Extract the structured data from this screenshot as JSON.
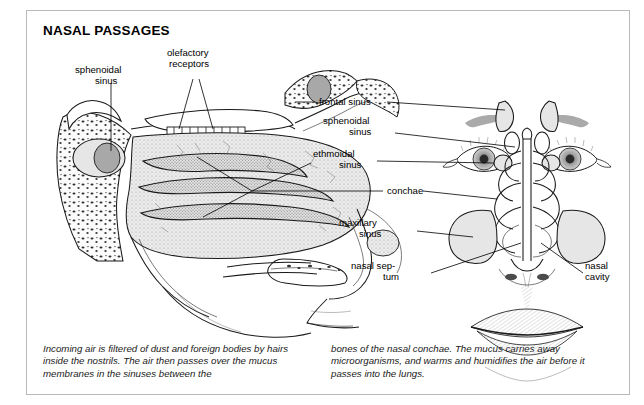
{
  "figure": {
    "title": "NASAL PASSAGES"
  },
  "labels": {
    "sphenoidal_sinus_left": "sphenoidal\nsinus",
    "sphenoidal_sinus_left_line1": "sphenoidal",
    "sphenoidal_sinus_left_line2": "sinus",
    "olefactory_receptors_line1": "olefactory",
    "olefactory_receptors_line2": "receptors",
    "frontal_sinus": "frontal sinus",
    "sphenoidal_sinus_right_line1": "sphenoidal",
    "sphenoidal_sinus_right_line2": "sinus",
    "ethmoidal_sinus_line1": "ethmoidal",
    "ethmoidal_sinus_line2": "sinus",
    "conchae": "conchae",
    "maxillary_sinus_line1": "maxillary",
    "maxillary_sinus_line2": "sinus",
    "nasal_septum_line1": "nasal sep-",
    "nasal_septum_line2": "tum",
    "nasal_cavity_line1": "nasal",
    "nasal_cavity_line2": "cavity"
  },
  "caption": {
    "left": "Incoming air is filtered of dust and foreign bodies by hairs inside the nostrils. The air then passes over the mucus membranes in the sinuses between the",
    "right": "bones of the nasal conchae. The mucus carries away microorganisms, and warms and humidifies the air before it passes into the lungs."
  },
  "colors": {
    "frame_border": "#b9b9b9",
    "ink": "#1a1a1a",
    "tissue_light": "#e6e6e6",
    "tissue_mid": "#cfcfcf",
    "tissue_dark": "#b0b0b0",
    "page_background": "#ffffff"
  }
}
